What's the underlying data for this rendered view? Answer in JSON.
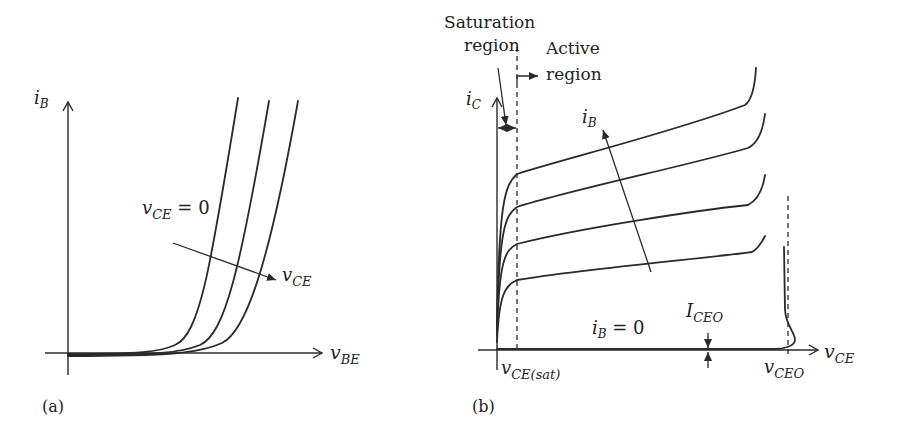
{
  "figure_a": {
    "panel_label": "(a)",
    "y_axis": {
      "symbol": "i",
      "sub": "B"
    },
    "x_axis": {
      "symbol": "v",
      "sub": "BE"
    },
    "param_start": {
      "symbol": "v",
      "sub": "CE",
      "suffix": " = 0"
    },
    "param_arrow": {
      "symbol": "v",
      "sub": "CE"
    },
    "curve_count": 3
  },
  "figure_b": {
    "panel_label": "(b)",
    "y_axis": {
      "symbol": "i",
      "sub": "C"
    },
    "x_axis": {
      "symbol": "v",
      "sub": "CE"
    },
    "saturation_label": [
      "Saturation",
      "region"
    ],
    "active_label": [
      "Active",
      "region"
    ],
    "param_arrow": {
      "symbol": "i",
      "sub": "B"
    },
    "zero_curve": {
      "symbol": "i",
      "sub": "B",
      "suffix": " = 0"
    },
    "leakage": {
      "symbol": "I",
      "sub": "CEO"
    },
    "vce_sat": {
      "symbol": "v",
      "sub": "CE(sat)"
    },
    "vceo": {
      "symbol": "v",
      "sub": "CEO"
    },
    "curve_count": 4
  },
  "colors": {
    "ink": "#2a2a2a",
    "background": "#ffffff"
  }
}
